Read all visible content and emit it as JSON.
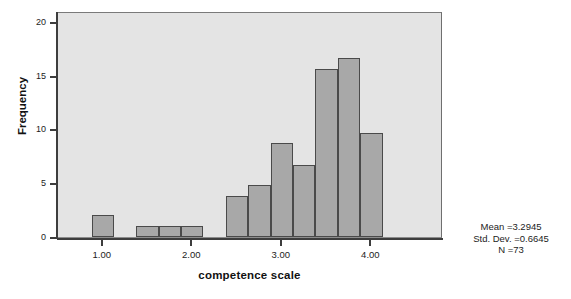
{
  "chart_data": {
    "type": "bar",
    "title": "",
    "subtitle": "",
    "xlabel": "competence scale",
    "ylabel": "Frequency",
    "xlim": [
      0.5,
      4.8
    ],
    "ylim": [
      0,
      21
    ],
    "grid": false,
    "legend": false,
    "bin_width": 0.25,
    "x_ticks": [
      "1.00",
      "2.00",
      "3.00",
      "4.00"
    ],
    "x_tick_values": [
      1.0,
      2.0,
      3.0,
      4.0
    ],
    "y_ticks": [
      "0",
      "5",
      "10",
      "15",
      "20"
    ],
    "y_tick_values": [
      0,
      5,
      10,
      15,
      20
    ],
    "bars": [
      {
        "bin_start": 0.875,
        "bin_end": 1.125,
        "center": 1.0,
        "value": 2
      },
      {
        "bin_start": 1.375,
        "bin_end": 1.625,
        "center": 1.5,
        "value": 1
      },
      {
        "bin_start": 1.625,
        "bin_end": 1.875,
        "center": 1.75,
        "value": 1
      },
      {
        "bin_start": 1.875,
        "bin_end": 2.125,
        "center": 2.0,
        "value": 1
      },
      {
        "bin_start": 2.375,
        "bin_end": 2.625,
        "center": 2.5,
        "value": 3.8
      },
      {
        "bin_start": 2.625,
        "bin_end": 2.875,
        "center": 2.75,
        "value": 4.8
      },
      {
        "bin_start": 2.875,
        "bin_end": 3.125,
        "center": 3.0,
        "value": 8.7
      },
      {
        "bin_start": 3.125,
        "bin_end": 3.375,
        "center": 3.25,
        "value": 6.7
      },
      {
        "bin_start": 3.375,
        "bin_end": 3.625,
        "center": 3.5,
        "value": 15.6
      },
      {
        "bin_start": 3.625,
        "bin_end": 3.875,
        "center": 3.75,
        "value": 16.6
      },
      {
        "bin_start": 3.875,
        "bin_end": 4.125,
        "center": 4.0,
        "value": 9.7
      }
    ],
    "categories": [
      "1.00",
      "1.50",
      "1.75",
      "2.00",
      "2.50",
      "2.75",
      "3.00",
      "3.25",
      "3.50",
      "3.75",
      "4.00"
    ],
    "values": [
      2,
      1,
      1,
      1,
      3.8,
      4.8,
      8.7,
      6.7,
      15.6,
      16.6,
      9.7
    ],
    "annotations": {
      "mean": "Mean =3.2945",
      "std_dev": "Std. Dev. =0.6645",
      "n": "N =73"
    },
    "colors": {
      "bar_fill": "#a8a8a8",
      "bar_edge": "#4a4a4a",
      "plot_background": "#e4e4e4",
      "axis": "#3d3d3d"
    }
  }
}
